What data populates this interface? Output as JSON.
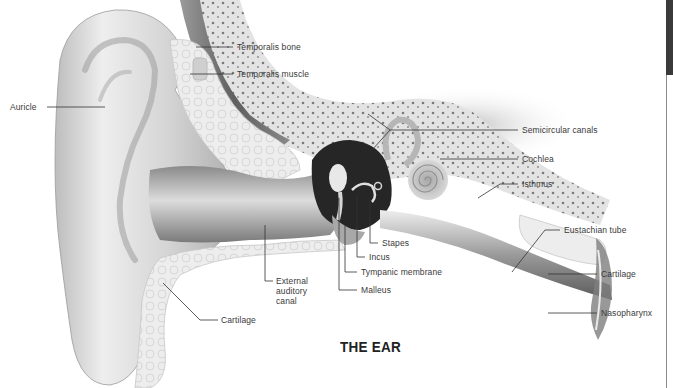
{
  "title": "THE EAR",
  "labels": {
    "auricle": "Auricle",
    "temporalis_bone": "Temporalis bone",
    "temporalis_muscle": "Temporalis muscle",
    "semicircular_canals": "Semicircular canals",
    "cochlea": "Cochlea",
    "isthmus": "Isthmus",
    "eustachian_tube": "Eustachian tube",
    "cartilage_right": "Cartilage",
    "nasopharynx": "Nasopharynx",
    "stapes": "Stapes",
    "incus": "Incus",
    "tympanic_membrane": "Tympanic membrane",
    "malleus": "Malleus",
    "external_auditory_canal": "External\nauditory\ncanal",
    "cartilage_left": "Cartilage"
  },
  "colors": {
    "label_text": "#3a3a3a",
    "leader_line": "#333333",
    "title_text": "#222222",
    "skin_light": "#ececec",
    "skin_mid": "#c8c8c8",
    "skin_dark": "#8e8e8e",
    "muscle": "#6e6e6e",
    "bone": "#e6e6e6",
    "cavity": "#1e1e1e"
  }
}
